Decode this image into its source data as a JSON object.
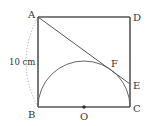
{
  "diagram": {
    "type": "geometry",
    "colors": {
      "stroke": "#555555",
      "text": "#333333",
      "dotted": "#aaaaaa"
    },
    "points": {
      "A": {
        "label": "A",
        "x": 38,
        "y": 17
      },
      "D": {
        "label": "D",
        "x": 130,
        "y": 17
      },
      "B": {
        "label": "B",
        "x": 38,
        "y": 107
      },
      "C": {
        "label": "C",
        "x": 130,
        "y": 107
      },
      "O": {
        "label": "O",
        "x": 84,
        "y": 107
      },
      "E": {
        "label": "E",
        "x": 130,
        "y": 84
      },
      "F": {
        "label": "F",
        "x": 108,
        "y": 67
      }
    },
    "side_label": "10 cm"
  }
}
